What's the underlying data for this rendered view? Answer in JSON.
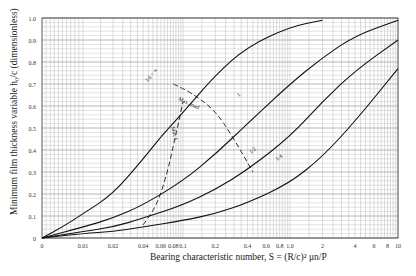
{
  "chart_data": {
    "type": "line",
    "title": "",
    "xlabel": "Bearing characteristic number, S = (R/c)^2 μn/P",
    "ylabel": "Minimum film thickness variable h0/c (dimensionless)",
    "xscale": "log (with 0 at origin)",
    "xlim": [
      0,
      10
    ],
    "ylim": [
      0,
      1.0
    ],
    "grid": true,
    "x_ticks": [
      "0",
      "0.01",
      "0.02",
      "0.04",
      "0.06",
      "0.08",
      "0.1",
      "0.2",
      "0.4",
      "0.6",
      "0.8",
      "1.0",
      "2",
      "4",
      "6",
      "8",
      "10"
    ],
    "y_ticks": [
      "0",
      "0.1",
      "0.2",
      "0.3",
      "0.4",
      "0.5",
      "0.6",
      "0.7",
      "0.8",
      "0.9",
      "1.0"
    ],
    "series": [
      {
        "name": "l/d = ∞",
        "x": [
          0,
          0.005,
          0.01,
          0.02,
          0.04,
          0.06,
          0.1,
          0.2,
          0.4,
          1.0,
          2.0
        ],
        "y": [
          0,
          0.05,
          0.11,
          0.2,
          0.36,
          0.46,
          0.57,
          0.74,
          0.87,
          0.96,
          0.99
        ]
      },
      {
        "name": "l/d = 1",
        "x": [
          0,
          0.01,
          0.02,
          0.04,
          0.1,
          0.2,
          0.4,
          1.0,
          2.0,
          4.0,
          10.0
        ],
        "y": [
          0,
          0.05,
          0.09,
          0.15,
          0.26,
          0.38,
          0.52,
          0.7,
          0.82,
          0.92,
          0.99
        ]
      },
      {
        "name": "l/d = 1/2",
        "x": [
          0,
          0.01,
          0.02,
          0.04,
          0.1,
          0.2,
          0.4,
          1.0,
          2.0,
          4.0,
          10.0
        ],
        "y": [
          0,
          0.03,
          0.05,
          0.09,
          0.15,
          0.22,
          0.31,
          0.46,
          0.62,
          0.76,
          0.9
        ]
      },
      {
        "name": "l/d = 1/4",
        "x": [
          0,
          0.01,
          0.02,
          0.04,
          0.1,
          0.2,
          0.4,
          1.0,
          2.0,
          4.0,
          10.0
        ],
        "y": [
          0,
          0.02,
          0.03,
          0.05,
          0.08,
          0.11,
          0.16,
          0.25,
          0.37,
          0.53,
          0.77
        ]
      },
      {
        "name": "Max. load",
        "style": "dashed",
        "x": [
          0.08,
          0.12,
          0.2,
          0.3,
          0.45
        ],
        "y": [
          0.7,
          0.66,
          0.58,
          0.45,
          0.3
        ]
      },
      {
        "name": "Min. f",
        "style": "dashed",
        "x": [
          0.04,
          0.055,
          0.07,
          0.08,
          0.09,
          0.1
        ],
        "y": [
          0.06,
          0.15,
          0.3,
          0.42,
          0.52,
          0.62
        ]
      }
    ],
    "annotations": [
      "l/d = ∞",
      "1",
      "1/2",
      "1/4",
      "Max. load",
      "Min. f"
    ]
  },
  "labels": {
    "ylabel_main": "Minimum film thickness variable",
    "ylabel_frac": "h₀/c",
    "ylabel_unit": "(dimensionless)",
    "xlabel": "Bearing characteristic number, S = (R/c)² μn/P",
    "curve_inf": "l/d = ∞",
    "curve_1": "1",
    "curve_half": "1/2",
    "curve_quarter": "1/4",
    "max_load": "Max. load",
    "min_f": "Min. f"
  }
}
